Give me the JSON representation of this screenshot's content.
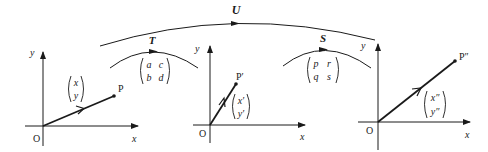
{
  "transformations": {
    "T": {
      "label": "T",
      "matrix": [
        [
          "a",
          "c"
        ],
        [
          "b",
          "d"
        ]
      ]
    },
    "S": {
      "label": "S",
      "matrix": [
        [
          "p",
          "r"
        ],
        [
          "q",
          "s"
        ]
      ]
    },
    "U": {
      "label": "U"
    }
  },
  "panels": [
    {
      "origin_label": "O",
      "x_axis_label": "x",
      "y_axis_label": "y",
      "point_label": "P",
      "vector": [
        "x",
        "y"
      ]
    },
    {
      "origin_label": "O",
      "x_axis_label": "x",
      "y_axis_label": "y",
      "point_label": "P′",
      "vector": [
        "x′",
        "y′"
      ]
    },
    {
      "origin_label": "O",
      "x_axis_label": "x",
      "y_axis_label": "y",
      "point_label": "P″",
      "vector": [
        "x″",
        "y″"
      ]
    }
  ],
  "colors": {
    "ink": "#1a1a1a",
    "background": "#ffffff"
  }
}
